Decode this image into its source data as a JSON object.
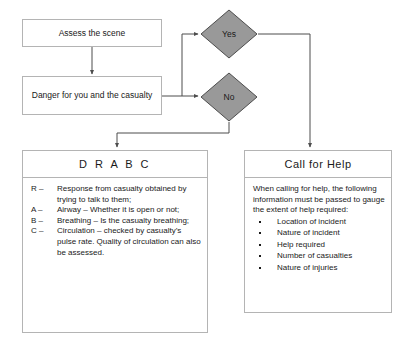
{
  "diagram": {
    "colors": {
      "background": "#ffffff",
      "box_border": "#b4b4b4",
      "diamond_fill": "#999999",
      "diamond_border": "#4d4d4d",
      "connector": "#4d4d4d",
      "text": "#1a1a1a"
    }
  },
  "nodes": {
    "assess": {
      "label": "Assess the scene"
    },
    "danger": {
      "label": "Danger for you and the casualty"
    },
    "yes": {
      "label": "Yes"
    },
    "no": {
      "label": "No"
    }
  },
  "panels": {
    "drabc": {
      "header": "D R A B C",
      "rows": [
        {
          "key": "R –",
          "text": "Response from casualty obtained by trying to talk to them;"
        },
        {
          "key": "A –",
          "text": "Airway – Whether it is open or not;"
        },
        {
          "key": "B –",
          "text": "Breathing – Is the casualty breathing;"
        },
        {
          "key": "C –",
          "text": "Circulation – checked by casualty’s pulse rate. Quality of circulation can also be assessed."
        }
      ]
    },
    "call_for_help": {
      "header": "Call for Help",
      "intro": "When calling for help, the following information must be passed to gauge the extent of help required:",
      "bullets": [
        "Location of incident",
        "Nature of incident",
        "Help required",
        "Number of casualties",
        "Nature of injuries"
      ]
    }
  },
  "connectors": [
    {
      "name": "assess-to-danger",
      "from": "assess",
      "to": "danger"
    },
    {
      "name": "danger-to-yes",
      "from": "danger",
      "to": "yes"
    },
    {
      "name": "danger-to-no",
      "from": "danger",
      "to": "no"
    },
    {
      "name": "no-to-drabc",
      "from": "no",
      "to": "drabc"
    },
    {
      "name": "yes-to-call-for-help",
      "from": "yes",
      "to": "call_for_help"
    }
  ]
}
